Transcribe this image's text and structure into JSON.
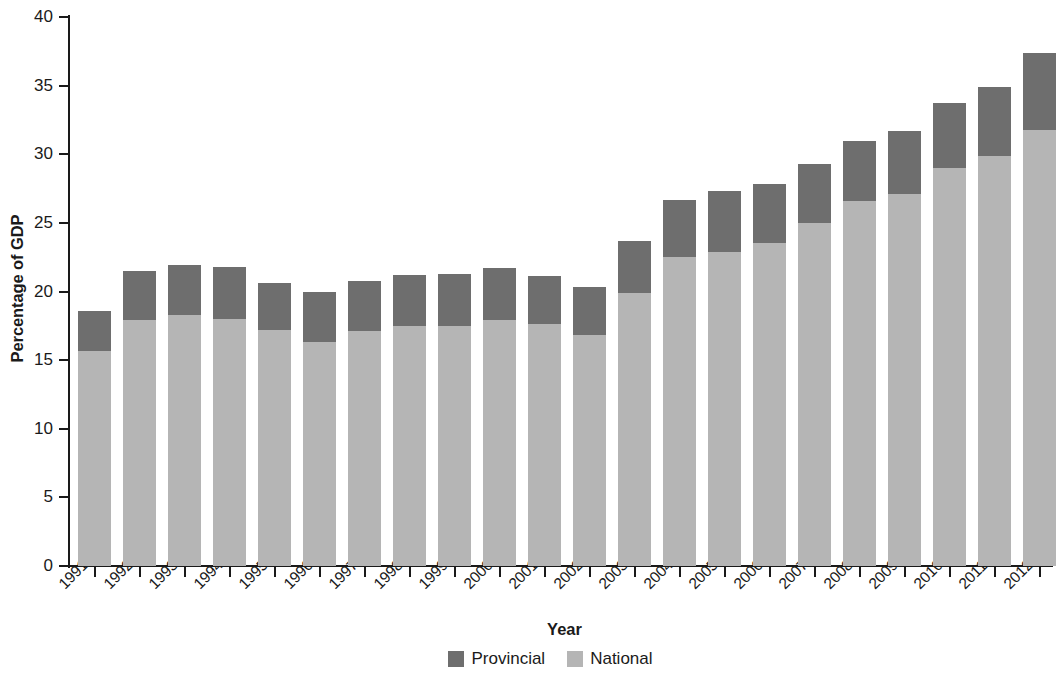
{
  "chart_data": {
    "type": "bar",
    "subtype": "stacked-vertical",
    "title": "",
    "xlabel": "Year",
    "ylabel": "Percentage of GDP",
    "ylim": [
      0,
      40
    ],
    "y_ticks": [
      0,
      5,
      10,
      15,
      20,
      25,
      30,
      35,
      40
    ],
    "y_tick_labels": [
      "0",
      "5",
      "10",
      "15",
      "20",
      "25",
      "30",
      "35",
      "40"
    ],
    "grid": false,
    "legend_position": "bottom-center",
    "categories": [
      "1991",
      "1992",
      "1993",
      "1994",
      "1995",
      "1996",
      "1997",
      "1998",
      "1999",
      "2000",
      "2001",
      "2002",
      "2003",
      "2004",
      "2005",
      "2006",
      "2007",
      "2008",
      "2009",
      "2010",
      "2011",
      "2012"
    ],
    "series": [
      {
        "name": "National",
        "color": "#b5b5b5",
        "stack_order": 0,
        "values": [
          15.7,
          17.9,
          18.3,
          18.0,
          17.2,
          16.3,
          17.1,
          17.5,
          17.5,
          17.9,
          17.6,
          16.8,
          19.9,
          22.5,
          22.9,
          23.5,
          25.0,
          26.6,
          27.1,
          29.0,
          29.9,
          31.8
        ]
      },
      {
        "name": "Provincial",
        "color": "#6e6e6e",
        "stack_order": 1,
        "values": [
          2.9,
          3.6,
          3.6,
          3.8,
          3.4,
          3.7,
          3.7,
          3.7,
          3.8,
          3.8,
          3.5,
          3.5,
          3.8,
          4.2,
          4.4,
          4.3,
          4.3,
          4.4,
          4.6,
          4.7,
          5.0,
          5.6
        ]
      }
    ],
    "totals": [
      18.6,
      21.5,
      21.9,
      21.8,
      20.6,
      20.0,
      20.8,
      21.2,
      21.3,
      21.7,
      21.1,
      20.3,
      23.7,
      26.7,
      27.3,
      27.8,
      29.3,
      31.0,
      31.7,
      33.7,
      34.9,
      37.4
    ],
    "legend": [
      {
        "label": "Provincial",
        "color": "#6e6e6e"
      },
      {
        "label": "National",
        "color": "#b5b5b5"
      }
    ]
  }
}
